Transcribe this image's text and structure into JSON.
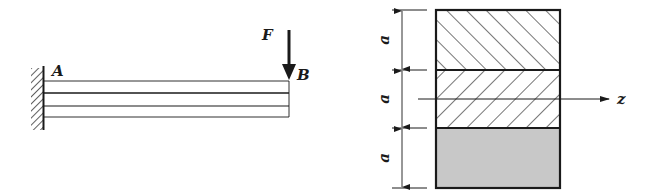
{
  "beam_figure": {
    "support": "fixed-wall",
    "labels": {
      "left_end": "A",
      "right_end": "B",
      "force": "F"
    },
    "layers": 3
  },
  "cross_section": {
    "layers": [
      {
        "pattern": "hatch-forward",
        "dimension": "a"
      },
      {
        "pattern": "hatch-backward",
        "dimension": "a"
      },
      {
        "pattern": "solid-gray",
        "dimension": "a"
      }
    ],
    "axis_label": "z",
    "colors": {
      "stroke": "#1a1a1a",
      "fill_gray": "#c8c8c8"
    }
  }
}
